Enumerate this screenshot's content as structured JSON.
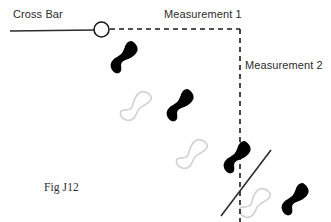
{
  "figure": {
    "caption": "Fig J12",
    "background_color": "#ffffff"
  },
  "labels": {
    "cross_bar": "Cross Bar",
    "measurement_1": "Measurement 1",
    "measurement_2": "Measurement 2"
  },
  "colors": {
    "ink": "#1a1a1a",
    "text": "#2b2b2b",
    "footprint_filled": "#000000",
    "footprint_outline": "#d2d2d2",
    "line": "#2b2b2b"
  },
  "chart_data": {
    "type": "diagram",
    "title": "Fig J12",
    "canvas": {
      "width": 331,
      "height": 222
    },
    "elements": [
      {
        "name": "cross-bar-line",
        "kind": "solid-line",
        "x1": 10,
        "y1": 31,
        "x2": 95,
        "y2": 30,
        "stroke": "#2b2b2b",
        "stroke_width": 1.6
      },
      {
        "name": "cross-bar-node",
        "kind": "circle",
        "cx": 101.5,
        "cy": 29.5,
        "r": 7.5,
        "stroke": "#1a1a1a",
        "stroke_width": 1.6,
        "fill": "#ffffff"
      },
      {
        "name": "measurement-1-baseline",
        "kind": "dashed-line",
        "x1": 110,
        "y1": 29,
        "x2": 240,
        "y2": 29,
        "stroke": "#1a1a1a",
        "stroke_width": 1.6,
        "dash": "5 4"
      },
      {
        "name": "measurement-2-baseline",
        "kind": "dashed-line",
        "x1": 240,
        "y1": 29,
        "x2": 240,
        "y2": 222,
        "stroke": "#1a1a1a",
        "stroke_width": 1.6,
        "dash": "5 4"
      },
      {
        "name": "angle-reference-line",
        "kind": "solid-line",
        "x1": 221,
        "y1": 216,
        "x2": 271,
        "y2": 150,
        "stroke": "#2b2b2b",
        "stroke_width": 1.6
      }
    ],
    "footprints": [
      {
        "index": 1,
        "foot": "right",
        "style": "filled",
        "cx": 125,
        "cy": 57,
        "rotation": 42,
        "length": 33,
        "width": 13
      },
      {
        "index": 2,
        "foot": "left",
        "style": "outline",
        "cx": 136,
        "cy": 105,
        "rotation": 42,
        "length": 33,
        "width": 13
      },
      {
        "index": 3,
        "foot": "right",
        "style": "filled",
        "cx": 181,
        "cy": 105,
        "rotation": 42,
        "length": 33,
        "width": 13
      },
      {
        "index": 4,
        "foot": "left",
        "style": "outline",
        "cx": 192,
        "cy": 153,
        "rotation": 42,
        "length": 33,
        "width": 13
      },
      {
        "index": 5,
        "foot": "right",
        "style": "filled",
        "cx": 238,
        "cy": 157,
        "rotation": 42,
        "length": 33,
        "width": 13
      },
      {
        "index": 6,
        "foot": "left",
        "style": "outline",
        "cx": 255,
        "cy": 202,
        "rotation": 42,
        "length": 33,
        "width": 13
      },
      {
        "index": 7,
        "foot": "right",
        "style": "filled",
        "cx": 296,
        "cy": 199,
        "rotation": 42,
        "length": 33,
        "width": 13
      }
    ],
    "annotations": [
      {
        "name": "cross-bar",
        "text": "Cross Bar",
        "x": 13,
        "y": 8
      },
      {
        "name": "measurement-1",
        "text": "Measurement 1",
        "x": 164,
        "y": 8
      },
      {
        "name": "measurement-2",
        "text": "Measurement 2",
        "x": 245,
        "y": 59
      },
      {
        "name": "fig-caption",
        "text": "Fig J12",
        "x": 44,
        "y": 181
      }
    ]
  }
}
